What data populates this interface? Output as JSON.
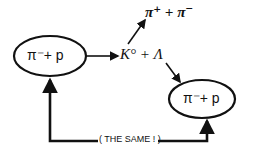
{
  "diagram": {
    "left_node": {
      "label": "π⁻+  p"
    },
    "right_node": {
      "label": "π⁻+  p"
    },
    "intermediate": {
      "label": "K° +  Λ"
    },
    "decay_products": {
      "label": "π⁺ + π⁻"
    },
    "loop_label": "( THE SAME ! )",
    "colors": {
      "ink": "#111111",
      "background": "#ffffff"
    }
  }
}
